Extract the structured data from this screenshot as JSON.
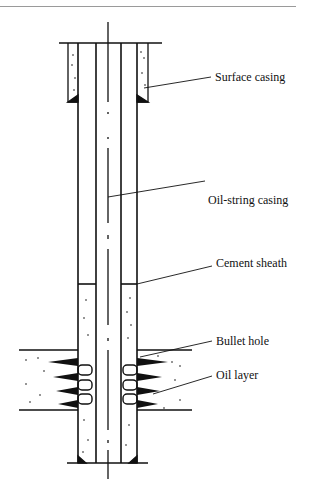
{
  "diagram": {
    "labels": {
      "surface_casing": "Surface casing",
      "oil_string_casing": "Oil-string casing",
      "cement_sheath": "Cement sheath",
      "bullet_hole": "Bullet hole",
      "oil_layer": "Oil layer"
    },
    "colors": {
      "line": "#111111",
      "divider": "#9a9a9a",
      "background": "#ffffff"
    }
  }
}
